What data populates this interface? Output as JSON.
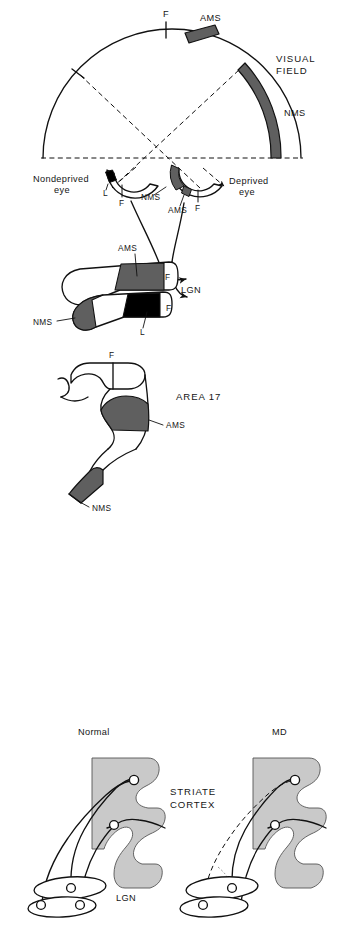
{
  "figure": {
    "title_semantic": "monocular-deprivation-visual-pathway-diagram",
    "colors": {
      "ink": "#111111",
      "paper": "#ffffff",
      "mid_gray": "#6b6b6b",
      "dark_gray": "#5f5f5f",
      "black_patch": "#000000",
      "cortex_gray": "#c9c9c9",
      "lgn_shrunken_gray": "#d2d2d2",
      "shrunken_patch": "#8e8e8e"
    }
  },
  "panel_top": {
    "name": "visual-field-and-eyes",
    "visual_field_label_line1": "VISUAL",
    "visual_field_label_line2": "FIELD",
    "arc_labels": {
      "fixation": "F",
      "ams": "AMS",
      "nms": "NMS"
    },
    "left_eye": {
      "label_line1": "Nondeprived",
      "label_line2": "eye",
      "patch_label": "L",
      "fixation_label": "F",
      "nms_label": "NMS"
    },
    "right_eye": {
      "label_line1": "Deprived",
      "label_line2": "eye",
      "patch_label": "AMS",
      "fixation_label": "F"
    }
  },
  "panel_lgn": {
    "name": "lateral-geniculate-nucleus",
    "title": "LGN",
    "upper_lamina_patch": "AMS",
    "lower_lamina_patch": "L",
    "nms_label": "NMS",
    "fixation_upper": "F",
    "fixation_lower": "F"
  },
  "panel_area17": {
    "name": "striate-cortex-area-17",
    "title": "AREA 17",
    "fixation_label": "F",
    "ams_label": "AMS",
    "nms_label": "NMS"
  },
  "panel_bottom": {
    "name": "normal-vs-md-comparison",
    "left_title": "Normal",
    "right_title": "MD",
    "striate_label_line1": "STRIATE",
    "striate_label_line2": "CORTEX",
    "lgn_label": "LGN"
  }
}
